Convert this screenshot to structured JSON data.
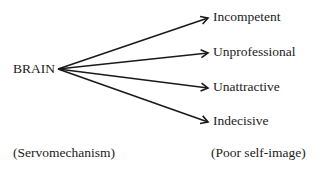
{
  "diagram": {
    "source": {
      "label": "BRAIN",
      "caption": "(Servomechanism)"
    },
    "targets": [
      {
        "label": "Incompetent"
      },
      {
        "label": "Unprofessional"
      },
      {
        "label": "Unattractive"
      },
      {
        "label": "Indecisive"
      }
    ],
    "targets_caption": "(Poor self-image)",
    "colors": {
      "line": "#1a1a1a",
      "text": "#222222",
      "background": "#ffffff"
    }
  }
}
